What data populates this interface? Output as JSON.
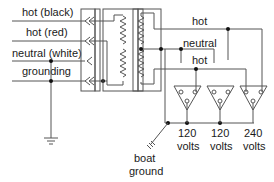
{
  "diagram": {
    "title": "",
    "input_wires": [
      {
        "label": "hot (black)"
      },
      {
        "label": "hot (red)"
      },
      {
        "label": "neutral (white)"
      },
      {
        "label": "grounding"
      }
    ],
    "bus_labels": {
      "hot_top": "hot",
      "neutral": "neutral",
      "hot_bottom": "hot"
    },
    "outlets": [
      {
        "voltage": "120",
        "unit": "volts"
      },
      {
        "voltage": "120",
        "unit": "volts"
      },
      {
        "voltage": "240",
        "unit": "volts"
      }
    ],
    "boat_ground": {
      "line1": "boat",
      "line2": "ground"
    },
    "colors": {
      "line": "#555555",
      "text": "#1a1a1a",
      "node": "#111111"
    }
  }
}
